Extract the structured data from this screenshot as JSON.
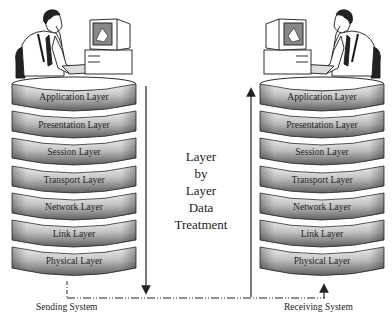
{
  "diagram": {
    "sending_system": {
      "label": "Sending System",
      "layers": [
        "Application Layer",
        "Presentation Layer",
        "Session Layer",
        "Transport Layer",
        "Network Layer",
        "Link Layer",
        "Physical Layer"
      ]
    },
    "receiving_system": {
      "label": "Receiving System",
      "layers": [
        "Application Layer",
        "Presentation Layer",
        "Session Layer",
        "Transport Layer",
        "Network Layer",
        "Link Layer",
        "Physical Layer"
      ]
    },
    "center_caption": [
      "Layer",
      "by",
      "Layer",
      "Data",
      "Treatment"
    ],
    "icons": {
      "left_figure": "person-at-computer-icon",
      "right_figure": "person-at-computer-icon",
      "down_arrow": "arrow-down-icon",
      "up_arrow": "arrow-up-icon"
    },
    "colors": {
      "band_dark": "#6e6e6e",
      "band_light": "#f2f2f2",
      "outline": "#2a2a2a"
    }
  }
}
